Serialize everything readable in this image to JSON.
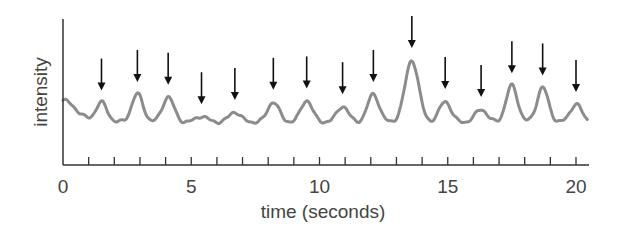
{
  "chart_data": {
    "type": "line",
    "title": "",
    "xlabel": "time (seconds)",
    "ylabel": "intensity",
    "xlim": [
      0,
      20.5
    ],
    "x_ticks_major": [
      0,
      5,
      10,
      15,
      20
    ],
    "x_tick_labels": [
      "0",
      "5",
      "10",
      "15",
      "20"
    ],
    "x_ticks_minor_step": 1,
    "y_ticks": [],
    "grid": false,
    "legend": null,
    "series": [
      {
        "name": "intensity",
        "color": "#8c8c8c",
        "peaks_seconds": [
          1.5,
          2.9,
          4.1,
          5.4,
          6.7,
          8.2,
          9.5,
          10.9,
          12.1,
          13.6,
          14.9,
          16.3,
          17.5,
          18.7,
          20.0
        ],
        "peak_relative_heights": [
          0.27,
          0.39,
          0.35,
          0.08,
          0.14,
          0.28,
          0.3,
          0.22,
          0.39,
          0.86,
          0.29,
          0.18,
          0.51,
          0.48,
          0.25
        ]
      }
    ],
    "annotations": {
      "type": "downward-arrows",
      "description": "arrow marks above each detected peak",
      "count": 15,
      "color": "#111111"
    }
  }
}
